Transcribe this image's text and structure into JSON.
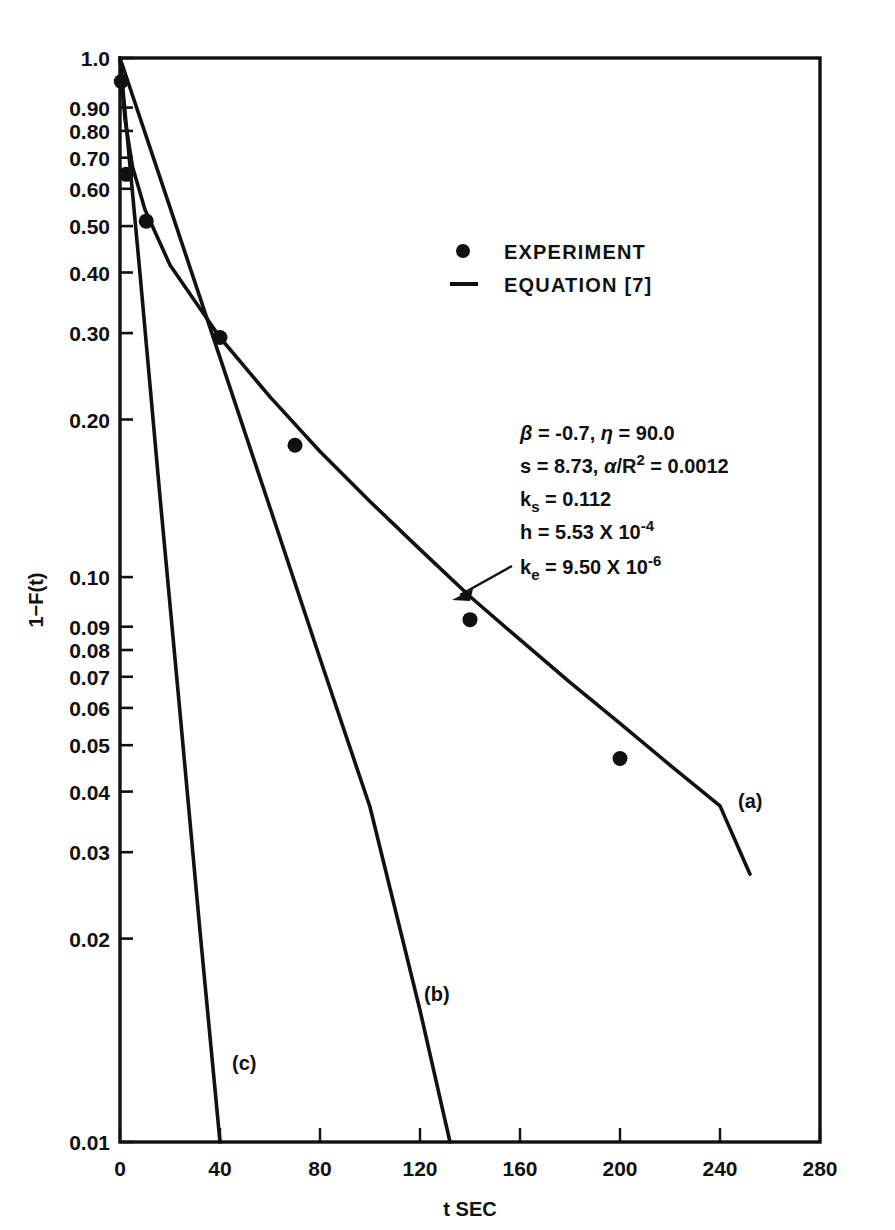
{
  "chart_data": {
    "type": "line",
    "title": "",
    "xlabel": "t SEC",
    "ylabel": "1−F(t)",
    "yscale": "log",
    "xlim": [
      0,
      280
    ],
    "ylim": [
      0.01,
      1.0
    ],
    "grid": false,
    "xticks": [
      0,
      40,
      80,
      120,
      160,
      200,
      240,
      280
    ],
    "xtick_labels": [
      "0",
      "40",
      "80",
      "120",
      "160",
      "200",
      "240",
      "280"
    ],
    "yticks": [
      1.0,
      0.9,
      0.8,
      0.7,
      0.6,
      0.5,
      0.4,
      0.3,
      0.2,
      0.1,
      0.09,
      0.08,
      0.07,
      0.06,
      0.05,
      0.04,
      0.03,
      0.02,
      0.01
    ],
    "ytick_labels": [
      "1.0",
      "0.90",
      "0.80",
      "0.70",
      "0.60",
      "0.50",
      "0.40",
      "0.30",
      "0.20",
      "0.10",
      "0.09",
      "0.08",
      "0.07",
      "0.06",
      "0.05",
      "0.04",
      "0.03",
      "0.02",
      "0.01"
    ],
    "legend_position": "upper-right",
    "legend": [
      {
        "marker": "dot",
        "label": "EXPERIMENT"
      },
      {
        "marker": "line",
        "label": "EQUATION [7]"
      }
    ],
    "series": [
      {
        "name": "EXPERIMENT",
        "type": "scatter",
        "marker": "filled-circle",
        "x": [
          0.5,
          2.5,
          10.5,
          40,
          70,
          140,
          200
        ],
        "y": [
          0.905,
          0.61,
          0.5,
          0.305,
          0.193,
          0.092,
          0.051
        ]
      },
      {
        "name": "EQUATION [7] curve (a)",
        "type": "line",
        "label": "(a)",
        "x": [
          0,
          2,
          5,
          10,
          20,
          40,
          60,
          80,
          100,
          120,
          140,
          160,
          180,
          200,
          220,
          240,
          252
        ],
        "y": [
          1.0,
          0.77,
          0.63,
          0.525,
          0.415,
          0.305,
          0.237,
          0.188,
          0.152,
          0.124,
          0.1015,
          0.0845,
          0.0705,
          0.0592,
          0.0496,
          0.0417,
          0.0312
        ]
      },
      {
        "name": "EQUATION [7] curve (b)",
        "type": "line",
        "label": "(b)",
        "x": [
          0,
          20,
          40,
          60,
          80,
          100,
          120,
          132
        ],
        "y": [
          1.0,
          0.53,
          0.28,
          0.148,
          0.078,
          0.0415,
          0.0175,
          0.01
        ]
      },
      {
        "name": "EQUATION [7] curve (c)",
        "type": "line",
        "label": "(c)",
        "x": [
          0,
          8,
          16,
          24,
          32,
          40
        ],
        "y": [
          1.0,
          0.4,
          0.155,
          0.062,
          0.0245,
          0.01
        ]
      }
    ],
    "annotations": [
      {
        "name": "parameter-box",
        "lines": [
          "β = -0.7,  η = 90.0",
          "s = 8.73,  α/R² = 0.0012",
          "kₛ = 0.112",
          "h = 5.53 X 10⁻⁴",
          "kₑ = 9.50 X 10⁻⁶"
        ]
      },
      {
        "name": "curve-pointer-arrow",
        "points_to": "(a)"
      }
    ]
  },
  "params": {
    "line1": {
      "beta_sym": "β",
      "eq1": " = -0.7, ",
      "eta_sym": "η",
      "eq2": " = 90.0"
    },
    "line2": {
      "s_label": "s = 8.73,  ",
      "alpha_sym": "α",
      "slash_r": "/R",
      "exp2": "2",
      "eq": " = 0.0012"
    },
    "line3": {
      "k": "k",
      "sub": "s",
      "val": " = 0.112"
    },
    "line4": {
      "h": "h = 5.53 X 10",
      "exp": "-4"
    },
    "line5": {
      "k": "k",
      "sub": "e",
      "val": " = 9.50 X 10",
      "exp": "-6"
    }
  },
  "curve_labels": {
    "a": "(a)",
    "b": "(b)",
    "c": "(c)"
  },
  "axis": {
    "x_title": "t SEC",
    "y_title_1": "1",
    "y_title_dash": "–",
    "y_title_2": "F(t)"
  }
}
